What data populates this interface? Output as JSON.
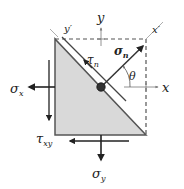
{
  "diagram": {
    "colors": {
      "fill": "#d9d9d9",
      "stroke": "#555555",
      "arrow": "#222222",
      "axis": "#888888",
      "dot": "#333333"
    },
    "labels": {
      "sigma_x": {
        "symbol": "σ",
        "sub": "x"
      },
      "sigma_y": {
        "symbol": "σ",
        "sub": "y"
      },
      "tau_xy": {
        "symbol": "τ",
        "sub": "xy"
      },
      "tau_n": {
        "symbol": "τ",
        "sub": "n"
      },
      "sigma_n": {
        "symbol": "σ",
        "sub": "n"
      },
      "theta": "θ",
      "axis_x": "x",
      "axis_y": "y",
      "axis_x_prime": "x′",
      "axis_y_prime": "y′"
    }
  }
}
